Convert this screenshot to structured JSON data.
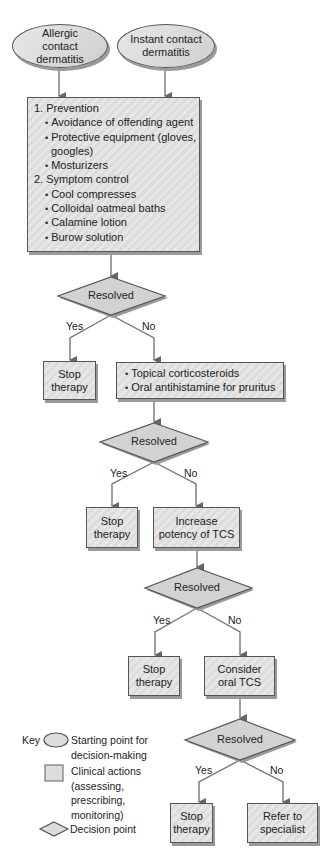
{
  "start_nodes": [
    {
      "label": "Allergic contact dermatitis"
    },
    {
      "label": "Instant contact dermatitis"
    }
  ],
  "initial_actions": {
    "sections": [
      {
        "heading": "1. Prevention",
        "items": [
          "Avoidance of offending agent",
          "Protective equipment (gloves,",
          "googles)",
          "Mosturizers"
        ]
      },
      {
        "heading": "2. Symptom control",
        "items": [
          "Cool compresses",
          "Colloidal oatmeal baths",
          "Calamine lotion",
          "Burow solution"
        ]
      }
    ]
  },
  "decisions": [
    {
      "label": "Resolved",
      "yes": "Yes",
      "no": "No"
    },
    {
      "label": "Resolved",
      "yes": "Yes",
      "no": "No"
    },
    {
      "label": "Resolved",
      "yes": "Yes",
      "no": "No"
    },
    {
      "label": "Resolved",
      "yes": "Yes",
      "no": "No"
    }
  ],
  "stop_boxes": [
    {
      "line1": "Stop",
      "line2": "therapy"
    },
    {
      "line1": "Stop",
      "line2": "therapy"
    },
    {
      "line1": "Stop",
      "line2": "therapy"
    },
    {
      "line1": "Stop",
      "line2": "therapy"
    }
  ],
  "no_actions": [
    {
      "items": [
        "Topical corticosteroids",
        "Oral antihistamine for pruritus"
      ]
    },
    {
      "line1": "Increase",
      "line2": "potency of TCS"
    },
    {
      "line1": "Consider",
      "line2": "oral TCS"
    },
    {
      "line1": "Refer to",
      "line2": "specialist"
    }
  ],
  "legend": {
    "key_label": "Key",
    "oval": [
      "Starting point for",
      "decision-making"
    ],
    "rect": [
      "Clinical actions",
      "(assessing,",
      "prescribing,",
      "monitoring)"
    ],
    "diamond": [
      "Decision point"
    ]
  },
  "colors": {
    "stroke": "#555555",
    "fill": "#d6d6d6",
    "shadow": "#9a9a9a"
  }
}
